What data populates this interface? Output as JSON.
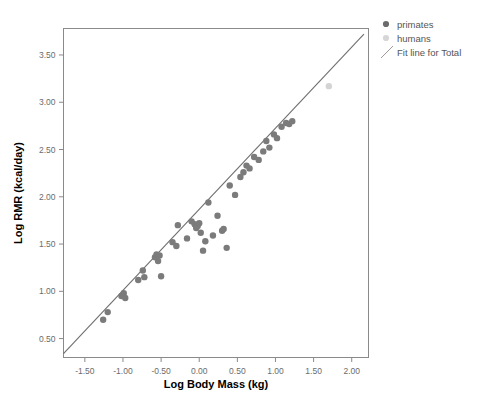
{
  "chart_data": {
    "type": "scatter",
    "title": "",
    "xlabel": "Log Body Mass (kg)",
    "ylabel": "Log RMR (kcal/day)",
    "xlim": [
      -1.78,
      2.22
    ],
    "ylim": [
      0.3,
      3.78
    ],
    "xticks": [
      -1.5,
      -1.0,
      -0.5,
      0.0,
      0.5,
      1.0,
      1.5,
      2.0
    ],
    "xticklabels": [
      "-1.50",
      "-1.00",
      "-0.50",
      "0.00",
      "0.50",
      "1.00",
      "1.50",
      "2.00"
    ],
    "yticks": [
      0.5,
      1.0,
      1.5,
      2.0,
      2.5,
      3.0,
      3.5
    ],
    "yticklabels": [
      "0.50",
      "1.00",
      "1.50",
      "2.00",
      "2.50",
      "3.00",
      "3.50"
    ],
    "grid": false,
    "legend_position": "outside-right-top",
    "series": [
      {
        "name": "primates",
        "marker": "circle",
        "color": "#7b7b7b",
        "points": [
          [
            -1.26,
            0.7
          ],
          [
            -1.2,
            0.78
          ],
          [
            -1.02,
            0.95
          ],
          [
            -0.99,
            0.98
          ],
          [
            -0.97,
            0.93
          ],
          [
            -0.8,
            1.12
          ],
          [
            -0.74,
            1.22
          ],
          [
            -0.72,
            1.15
          ],
          [
            -0.58,
            1.36
          ],
          [
            -0.56,
            1.39
          ],
          [
            -0.54,
            1.32
          ],
          [
            -0.52,
            1.38
          ],
          [
            -0.5,
            1.16
          ],
          [
            -0.35,
            1.52
          ],
          [
            -0.3,
            1.48
          ],
          [
            -0.28,
            1.7
          ],
          [
            -0.16,
            1.56
          ],
          [
            -0.1,
            1.74
          ],
          [
            -0.06,
            1.71
          ],
          [
            -0.04,
            1.67
          ],
          [
            -0.02,
            1.69
          ],
          [
            0.0,
            1.72
          ],
          [
            0.02,
            1.62
          ],
          [
            0.05,
            1.43
          ],
          [
            0.08,
            1.53
          ],
          [
            0.12,
            1.94
          ],
          [
            0.18,
            1.59
          ],
          [
            0.24,
            1.8
          ],
          [
            0.3,
            1.64
          ],
          [
            0.32,
            1.66
          ],
          [
            0.36,
            1.46
          ],
          [
            0.4,
            2.12
          ],
          [
            0.47,
            2.02
          ],
          [
            0.54,
            2.21
          ],
          [
            0.58,
            2.26
          ],
          [
            0.62,
            2.33
          ],
          [
            0.66,
            2.3
          ],
          [
            0.72,
            2.42
          ],
          [
            0.78,
            2.39
          ],
          [
            0.84,
            2.48
          ],
          [
            0.88,
            2.59
          ],
          [
            0.92,
            2.52
          ],
          [
            0.98,
            2.66
          ],
          [
            1.02,
            2.62
          ],
          [
            1.08,
            2.74
          ],
          [
            1.14,
            2.78
          ],
          [
            1.18,
            2.77
          ],
          [
            1.22,
            2.8
          ]
        ]
      },
      {
        "name": "humans",
        "marker": "circle",
        "color": "#d4d4d4",
        "points": [
          [
            1.7,
            3.17
          ]
        ]
      }
    ],
    "fit_line": {
      "name": "Fit line for Total",
      "color": "#6e6e6e",
      "x0": -1.78,
      "y0": 0.34,
      "x1": 2.16,
      "y1": 3.72
    }
  },
  "legend": {
    "items": [
      {
        "label": "primates",
        "kind": "marker",
        "color": "#6b6b6b"
      },
      {
        "label": "humans",
        "kind": "marker",
        "color": "#d6d6d6"
      },
      {
        "label": "Fit line for Total",
        "kind": "line",
        "color": "#9a9a9a"
      }
    ]
  }
}
